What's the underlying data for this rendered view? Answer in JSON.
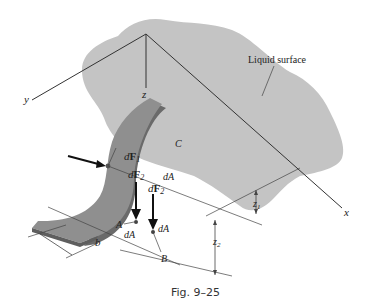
{
  "figure": {
    "caption": "Fig. 9–25",
    "surface_label": "Liquid surface"
  },
  "axes": {
    "x": "x",
    "y": "y",
    "z": "z"
  },
  "labels": {
    "C": "C",
    "A": "A",
    "B": "B",
    "b": "b",
    "dF1_d": "d",
    "dF1_F": "F",
    "dF1_sub": "1",
    "dF2_d": "d",
    "dF2_F": "F",
    "dF2_sub": "2",
    "dA": "dA",
    "z1": "z",
    "z1_sub": "1",
    "z2": "z",
    "z2_sub": "2"
  },
  "colors": {
    "surface": "#c4c4c4",
    "plate": "#8f8f8f",
    "plate_edge": "#6a6a6a",
    "line": "#333333"
  }
}
